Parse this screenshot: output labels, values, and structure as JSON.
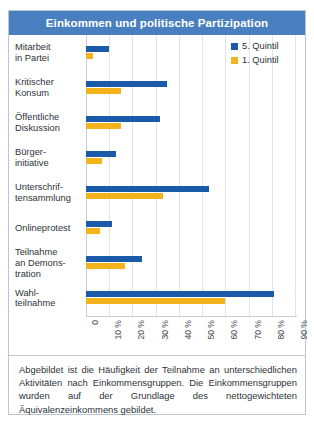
{
  "header": {
    "title": "Einkommen und politische Partizipation",
    "background_color": "#4a7fbf",
    "text_color": "#ffffff"
  },
  "legend": {
    "items": [
      {
        "label": "5. Quintil",
        "color": "#1a5aa8",
        "key": "q5"
      },
      {
        "label": "1. Quintil",
        "color": "#f2b31c",
        "key": "q1"
      }
    ]
  },
  "footnote": {
    "text": "Abgebildet ist die Häufigkeit der Teilnahme an unterschiedlichen Aktivitäten nach Einkommensgruppen. Die Einkommensgruppen wurden auf der Grundlage des nettogewichteten Äquivalenzeinkommens gebildet."
  },
  "chart_data": {
    "type": "bar",
    "orientation": "horizontal",
    "title": "Einkommen und politische Partizipation",
    "xlabel": "",
    "ylabel": "",
    "xlim": [
      0,
      90
    ],
    "xticks": [
      0,
      10,
      20,
      30,
      40,
      50,
      60,
      70,
      80,
      90
    ],
    "xtick_labels": [
      "0",
      "10 %",
      "20 %",
      "30 %",
      "40 %",
      "50 %",
      "60 %",
      "70 %",
      "80 %",
      "90 %"
    ],
    "grid": true,
    "legend_position": "top-right",
    "categories": [
      "Mitarbeit in Partei",
      "Kritischer Konsum",
      "Öffentliche Diskussion",
      "Bürgerinitiative",
      "Unterschriftensammlung",
      "Onlineprotest",
      "Teilnahme an Demonstration",
      "Wahlteilnahme"
    ],
    "category_label_lines": [
      [
        "Mitarbeit",
        "in Partei"
      ],
      [
        "Kritischer",
        "Konsum"
      ],
      [
        "Öffentliche",
        "Diskussion"
      ],
      [
        "Bürger-",
        "initiative"
      ],
      [
        "Unterschrif-",
        "tensammlung"
      ],
      [
        "Onlineprotest"
      ],
      [
        "Teilnahme",
        "an Demons-",
        "tration"
      ],
      [
        "Wahl-",
        "teilnahme"
      ]
    ],
    "series": [
      {
        "name": "5. Quintil",
        "color": "#1a5aa8",
        "values": [
          10,
          35,
          32,
          13,
          53,
          11,
          24,
          81
        ]
      },
      {
        "name": "1. Quintil",
        "color": "#f2b31c",
        "values": [
          3,
          15,
          15,
          7,
          33,
          6,
          17,
          60
        ]
      }
    ]
  }
}
